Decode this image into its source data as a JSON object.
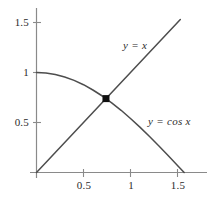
{
  "chart_data": {
    "type": "line",
    "title": "",
    "xlabel": "",
    "ylabel": "",
    "xlim": [
      0,
      1.75
    ],
    "ylim": [
      0,
      1.64
    ],
    "grid": false,
    "legend_position": "inline-annotation",
    "x_ticks": [
      {
        "value": 0.5,
        "label": "0.5"
      },
      {
        "value": 1,
        "label": "1"
      },
      {
        "value": 1.5,
        "label": "1.5"
      }
    ],
    "y_ticks": [
      {
        "value": 0.5,
        "label": "0.5"
      },
      {
        "value": 1,
        "label": "1"
      },
      {
        "value": 1.5,
        "label": "1.5"
      }
    ],
    "series": [
      {
        "name": "y = x",
        "label": "y = x",
        "kind": "line",
        "color": "#4d4d4d",
        "x": [
          0,
          0.2,
          0.4,
          0.6,
          0.8,
          1.0,
          1.2,
          1.4,
          1.53
        ],
        "values": [
          0,
          0.2,
          0.4,
          0.6,
          0.8,
          1.0,
          1.2,
          1.4,
          1.53
        ]
      },
      {
        "name": "y = cos x",
        "label": "y = cos x",
        "kind": "curve",
        "color": "#4d4d4d",
        "x": [
          0,
          0.1,
          0.2,
          0.3,
          0.4,
          0.5,
          0.6,
          0.7,
          0.8,
          0.9,
          1.0,
          1.1,
          1.2,
          1.3,
          1.4,
          1.5,
          1.5708
        ],
        "values": [
          1,
          0.995,
          0.98,
          0.955,
          0.921,
          0.878,
          0.825,
          0.765,
          0.697,
          0.622,
          0.54,
          0.454,
          0.362,
          0.268,
          0.17,
          0.071,
          0
        ]
      }
    ],
    "annotations": [
      {
        "name": "intersection-point",
        "marker": "square",
        "x": 0.739,
        "y": 0.739,
        "color": "#101010"
      }
    ],
    "axes": {
      "x_axis_color": "#8a8a8a",
      "y_axis_color": "#8a8a8a",
      "origin_label": ""
    }
  },
  "labels": {
    "line_label": "y = x",
    "curve_label": "y = cos x"
  }
}
